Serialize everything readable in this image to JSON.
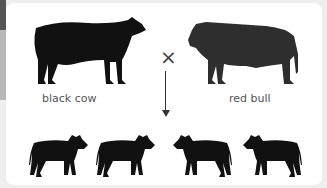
{
  "parents": {
    "left": {
      "label": "black cow",
      "color": "#111111"
    },
    "right": {
      "label": "red bull",
      "color": "#2e2e2e"
    }
  },
  "operator": "×",
  "offspring": [
    {
      "facing": "right",
      "color": "#111111"
    },
    {
      "facing": "right",
      "color": "#111111"
    },
    {
      "facing": "left",
      "color": "#111111"
    },
    {
      "facing": "left",
      "color": "#111111"
    }
  ]
}
